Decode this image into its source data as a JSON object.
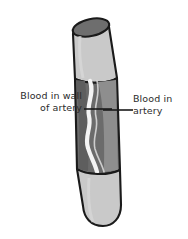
{
  "figure": {
    "type": "anatomical-diagram",
    "background_color": "#ffffff"
  },
  "labels": {
    "wall": {
      "line1": "Blood in wall",
      "line2": "of artery",
      "leader": "horizontal-line-right"
    },
    "lumen": {
      "line1": "Blood in",
      "line2": "artery",
      "leader": "horizontal-line-left"
    }
  },
  "colors": {
    "outline": "#1a1a1a",
    "tube_outer": "#c9c9c9",
    "tube_top_ellipse": "#6e6e6e",
    "wall_dark": "#6b6b6b",
    "wall_mid": "#8a8a8a",
    "blood_streak": "#f2f2f2",
    "lumen_inner": "#9a9a9a",
    "text": "#2b2b2b"
  },
  "parts": [
    {
      "name": "upper-tube-segment",
      "shade": "light-gray"
    },
    {
      "name": "top-ellipse-opening",
      "shade": "dark-gray"
    },
    {
      "name": "cutaway-middle-segment",
      "shade": "dark-gray"
    },
    {
      "name": "wavy-blood-channel",
      "shade": "white"
    },
    {
      "name": "lower-tube-segment",
      "shade": "light-gray"
    }
  ]
}
